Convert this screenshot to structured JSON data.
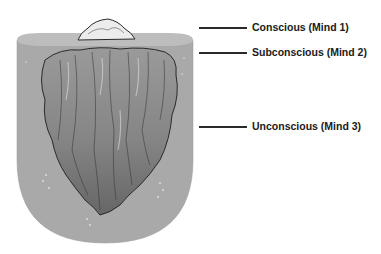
{
  "labels": [
    {
      "text": "Conscious (Mind 1)",
      "level": "tip above water"
    },
    {
      "text": "Subconscious (Mind 2)",
      "level": "water surface"
    },
    {
      "text": "Unconscious (Mind 3)",
      "level": "submerged mass"
    }
  ],
  "colors": {
    "water": "#a9a9a9",
    "water_surface": "#bdbdbd",
    "ice_tip": "#ececec",
    "ice_body_light": "#8f8f8f",
    "ice_body_dark": "#6c6c6c",
    "outline": "#2a2a2a"
  }
}
